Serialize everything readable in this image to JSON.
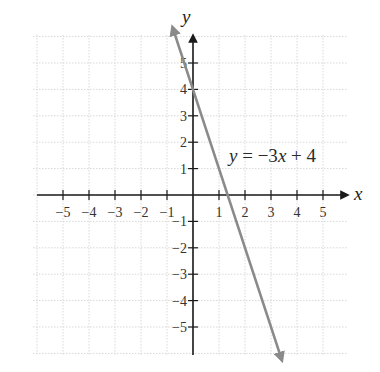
{
  "chart_data": {
    "type": "line",
    "title": "",
    "xlabel": "x",
    "ylabel": "y",
    "xlim": [
      -6,
      6
    ],
    "ylim": [
      -6,
      6.3
    ],
    "grid": true,
    "x_ticks": [
      -5,
      -4,
      -3,
      -2,
      -1,
      1,
      2,
      3,
      4,
      5
    ],
    "y_ticks": [
      5,
      4,
      3,
      2,
      1,
      -1,
      -2,
      -3,
      -4,
      -5
    ],
    "x_tick_labels": [
      "−5",
      "−4",
      "−3",
      "−2",
      "−1",
      "1",
      "2",
      "3",
      "4",
      "5"
    ],
    "y_tick_labels": [
      "5",
      "4",
      "3",
      "2",
      "1",
      "−1",
      "−2",
      "−3",
      "−4",
      "−5"
    ],
    "series": [
      {
        "name": "y = −3x + 4",
        "equation": {
          "slope": -3,
          "intercept": 4
        },
        "x": [
          -0.77,
          0,
          1.333,
          2,
          3,
          3.4
        ],
        "y": [
          6.3,
          4,
          0,
          -2,
          -5,
          -6.2
        ],
        "color": "#8a8a8a",
        "arrows": "both"
      }
    ],
    "annotations": [
      {
        "text": "y = −3x + 4",
        "x": 1.5,
        "y": 1.4
      }
    ],
    "legend": null
  },
  "labels": {
    "x_axis": "x",
    "y_axis": "y",
    "equation_y": "y",
    "equation_eq": " = −3",
    "equation_x": "x",
    "equation_rest": " + 4"
  }
}
